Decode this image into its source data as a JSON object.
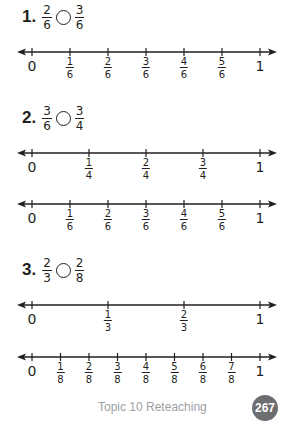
{
  "problems": [
    {
      "number": "1.",
      "left": {
        "num": "2",
        "den": "6"
      },
      "right": {
        "num": "3",
        "den": "6"
      }
    },
    {
      "number": "2.",
      "left": {
        "num": "3",
        "den": "6"
      },
      "right": {
        "num": "3",
        "den": "4"
      }
    },
    {
      "number": "3.",
      "left": {
        "num": "2",
        "den": "3"
      },
      "right": {
        "num": "2",
        "den": "8"
      }
    }
  ],
  "number_lines": [
    {
      "id": "p1-sixths",
      "labels": [
        "0",
        "1/6",
        "2/6",
        "3/6",
        "4/6",
        "5/6",
        "1"
      ]
    },
    {
      "id": "p2-fourths",
      "labels": [
        "0",
        "1/4",
        "2/4",
        "3/4",
        "1"
      ]
    },
    {
      "id": "p2-sixths",
      "labels": [
        "0",
        "1/6",
        "2/6",
        "3/6",
        "4/6",
        "5/6",
        "1"
      ]
    },
    {
      "id": "p3-thirds",
      "labels": [
        "0",
        "1/3",
        "2/3",
        "1"
      ]
    },
    {
      "id": "p3-eighths",
      "labels": [
        "0",
        "1/8",
        "2/8",
        "3/8",
        "4/8",
        "5/8",
        "6/8",
        "7/8",
        "1"
      ]
    }
  ],
  "footer": {
    "label": "Topic 10 Reteaching",
    "page_number": "267",
    "badge_color": "#6d6e71",
    "label_color": "#9d9fa2"
  }
}
